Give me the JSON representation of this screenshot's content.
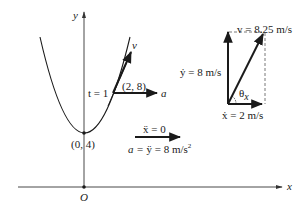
{
  "axes": {
    "x_label": "x",
    "y_label": "y",
    "origin_label": "O"
  },
  "curve": {
    "vertex_label": "(0, 4)",
    "point_label": "(2, 8)",
    "time_label": "t = 1",
    "velocity_label": "v",
    "acceleration_label": "a"
  },
  "acceleration_annotation": {
    "x_ddot": "ẍ = 0",
    "a_prefix": "a = ",
    "y_ddot": "ÿ = 8 m/s",
    "superscript": "2"
  },
  "velocity_components": {
    "v_magnitude": "v = 8.25 m/s",
    "y_dot": "ẏ = 8 m/s",
    "x_dot": "ẋ = 2 m/s",
    "angle_label": "θ",
    "angle_subscript": "x"
  },
  "colors": {
    "ink": "#1a1a1a",
    "axis": "#333333",
    "dashed": "#555555"
  }
}
